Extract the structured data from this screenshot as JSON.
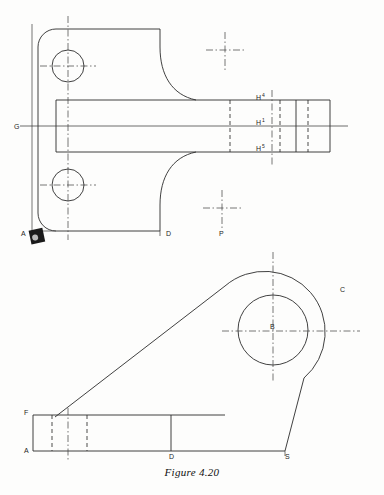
{
  "figure": {
    "caption": "Figure 4.20",
    "type": "engineering-drawing",
    "background_color": "#fdfdfc",
    "line_color": "#2b2b2b"
  },
  "top_view": {
    "name": "front-view-bracket",
    "labels": [
      {
        "id": "G",
        "text": "G",
        "x": 14,
        "y": 128
      },
      {
        "id": "A",
        "text": "A",
        "x": 22,
        "y": 235
      },
      {
        "id": "D",
        "text": "D",
        "x": 168,
        "y": 235
      },
      {
        "id": "P",
        "text": "P",
        "x": 220,
        "y": 235
      },
      {
        "id": "H4",
        "text": "H",
        "sup": "4",
        "x": 258,
        "y": 99
      },
      {
        "id": "H1",
        "text": "H",
        "sup": "1",
        "x": 258,
        "y": 124
      },
      {
        "id": "H5",
        "text": "H",
        "sup": "5",
        "x": 258,
        "y": 150
      }
    ],
    "holes": [
      {
        "id": "upper-hole",
        "cx": 68,
        "cy": 66,
        "r": 16
      },
      {
        "id": "lower-hole",
        "cx": 68,
        "cy": 185,
        "r": 16
      }
    ],
    "cross_markers": [
      {
        "id": "upper-cross",
        "cx": 225,
        "cy": 50
      },
      {
        "id": "lower-cross",
        "cx": 222,
        "cy": 208
      }
    ]
  },
  "bottom_view": {
    "name": "side-view-bracket",
    "labels": [
      {
        "id": "F",
        "text": "F",
        "x": 25,
        "y": 412
      },
      {
        "id": "A",
        "text": "A",
        "x": 25,
        "y": 456
      },
      {
        "id": "D",
        "text": "D",
        "x": 172,
        "y": 456
      },
      {
        "id": "S",
        "text": "S",
        "x": 288,
        "y": 456
      },
      {
        "id": "B",
        "text": "B",
        "x": 272,
        "y": 332
      },
      {
        "id": "C",
        "text": "C",
        "x": 343,
        "y": 290
      }
    ],
    "boss": {
      "id": "boss-circles",
      "cx": 273,
      "cy": 330,
      "outer_r": 57,
      "inner_r": 35
    }
  }
}
